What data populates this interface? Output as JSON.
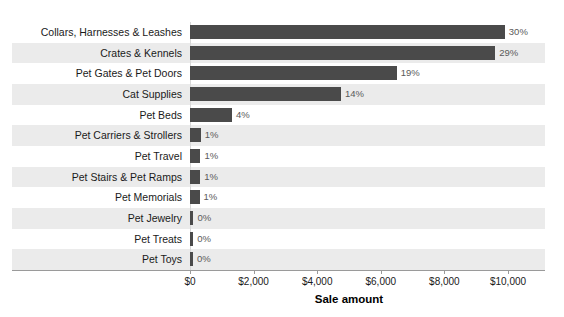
{
  "chart_data": {
    "type": "bar",
    "orientation": "horizontal",
    "title": "",
    "xlabel": "Sale amount",
    "ylabel": "",
    "xlim": [
      0,
      10000
    ],
    "grid": false,
    "legend": "none",
    "tick_labels": [
      "$0",
      "$2,000",
      "$4,000",
      "$6,000",
      "$8,000",
      "$10,000"
    ],
    "tick_values": [
      0,
      2000,
      4000,
      6000,
      8000,
      10000
    ],
    "categories": [
      "Collars, Harnesses & Leashes",
      "Crates & Kennels",
      "Pet Gates & Pet Doors",
      "Cat Supplies",
      "Pet Beds",
      "Pet Carriers & Strollers",
      "Pet Travel",
      "Pet Stairs & Pet Ramps",
      "Pet Memorials",
      "Pet Jewelry",
      "Pet Treats",
      "Pet Toys"
    ],
    "values": [
      9900,
      9600,
      6500,
      4750,
      1320,
      340,
      330,
      320,
      300,
      110,
      100,
      90
    ],
    "data_labels": [
      "30%",
      "29%",
      "19%",
      "14%",
      "4%",
      "1%",
      "1%",
      "1%",
      "1%",
      "0%",
      "0%",
      "0%"
    ],
    "colors": {
      "bar": "#4a4a4a",
      "band_shaded": "#ebebeb",
      "band_plain": "#ffffff",
      "axis": "#9a9a9a",
      "label_text": "#1a1a1a",
      "value_text": "#5a5a5a",
      "background": "#ffffff"
    }
  }
}
